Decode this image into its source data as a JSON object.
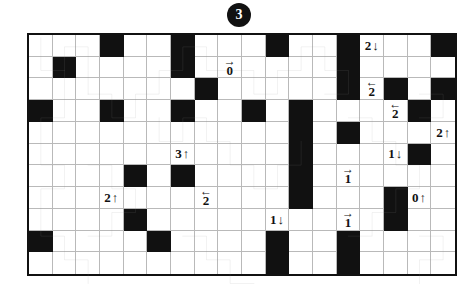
{
  "puzzle": {
    "number": "3",
    "type": "loop-path-grid-puzzle",
    "grid": {
      "columns": 18,
      "rows": 11
    },
    "colors": {
      "block": "#111111",
      "loop": "#9a9a9a",
      "gridline": "#b9b9b9",
      "border": "#111111",
      "background": "#ffffff"
    },
    "blocked_cells": [
      [
        0,
        3
      ],
      [
        0,
        6
      ],
      [
        0,
        10
      ],
      [
        0,
        13
      ],
      [
        0,
        17
      ],
      [
        1,
        1
      ],
      [
        1,
        6
      ],
      [
        1,
        13
      ],
      [
        2,
        7
      ],
      [
        2,
        13
      ],
      [
        2,
        15
      ],
      [
        2,
        17
      ],
      [
        3,
        0
      ],
      [
        3,
        3
      ],
      [
        3,
        6
      ],
      [
        3,
        9
      ],
      [
        3,
        11
      ],
      [
        3,
        16
      ],
      [
        4,
        11
      ],
      [
        4,
        13
      ],
      [
        5,
        11
      ],
      [
        5,
        16
      ],
      [
        6,
        4
      ],
      [
        6,
        6
      ],
      [
        6,
        11
      ],
      [
        7,
        11
      ],
      [
        7,
        15
      ],
      [
        8,
        4
      ],
      [
        8,
        15
      ],
      [
        9,
        0
      ],
      [
        9,
        5
      ],
      [
        9,
        10
      ],
      [
        9,
        13
      ],
      [
        10,
        10
      ],
      [
        10,
        13
      ]
    ],
    "clues": [
      {
        "row": 0,
        "col": 14,
        "value": "2",
        "arrow": "down",
        "layout": "inline"
      },
      {
        "row": 1,
        "col": 8,
        "value": "0",
        "arrow": "right",
        "layout": "stacked"
      },
      {
        "row": 2,
        "col": 14,
        "value": "2",
        "arrow": "left",
        "layout": "stacked"
      },
      {
        "row": 3,
        "col": 15,
        "value": "2",
        "arrow": "left",
        "layout": "stacked"
      },
      {
        "row": 4,
        "col": 13,
        "value": "5",
        "arrow": "left",
        "layout": "stacked"
      },
      {
        "row": 4,
        "col": 17,
        "value": "2",
        "arrow": "up",
        "layout": "inline"
      },
      {
        "row": 5,
        "col": 6,
        "value": "3",
        "arrow": "up",
        "layout": "inline"
      },
      {
        "row": 5,
        "col": 15,
        "value": "1",
        "arrow": "down",
        "layout": "inline"
      },
      {
        "row": 5,
        "col": 16,
        "value": "2",
        "arrow": "up",
        "layout": "inline"
      },
      {
        "row": 6,
        "col": 6,
        "value": "1",
        "arrow": "right",
        "layout": "stacked"
      },
      {
        "row": 6,
        "col": 13,
        "value": "1",
        "arrow": "right",
        "layout": "stacked"
      },
      {
        "row": 7,
        "col": 3,
        "value": "2",
        "arrow": "up",
        "layout": "inline"
      },
      {
        "row": 7,
        "col": 7,
        "value": "2",
        "arrow": "left",
        "layout": "stacked"
      },
      {
        "row": 7,
        "col": 16,
        "value": "0",
        "arrow": "up",
        "layout": "inline"
      },
      {
        "row": 8,
        "col": 10,
        "value": "1",
        "arrow": "down",
        "layout": "inline"
      },
      {
        "row": 8,
        "col": 13,
        "value": "1",
        "arrow": "right",
        "layout": "stacked"
      },
      {
        "row": 8,
        "col": 15,
        "value": "1",
        "arrow": "down",
        "layout": "inline"
      },
      {
        "row": 9,
        "col": 5,
        "value": "2",
        "arrow": "left",
        "layout": "stacked"
      }
    ],
    "arrow_glyphs": {
      "up": "↑",
      "down": "↓",
      "left": "←",
      "right": "→"
    },
    "loop_segments": [
      "M 0.5 0.12 L 0.5 1.5 L 1.5 1.5 L 1.5 0.5 L 2.5 0.5 L 2.5 1.5 L 2.5 2.5",
      "M 1.5 1.5 L 1.5 3.5 L 0.5 3.5 L 0.5 5.5 L 1.5 5.5 L 1.5 6.5 L 0.5 6.5 L 0.5 8.5 L 1.5 8.5 L 1.5 9.5 L 2.5 9.5 L 2.5 10.5",
      "M 2.5 2.5 L 3.5 2.5 L 3.5 3.5 L 4.5 3.5 L 4.5 2.5 L 5.5 2.5 L 5.5 1.5 L 6.5 1.5 L 6.5 0.5 L 7.5 0.5 L 7.5 1.5 L 8.5 1.5",
      "M 2.5 5.5 L 3.5 5.5 L 3.5 6.5 L 4.5 6.5 L 4.5 7.5 L 3.5 7.5 L 3.5 8.5 L 2.5 8.5",
      "M 5.5 3.5 L 5.5 4.5 L 6.5 4.5 L 6.5 3.5 L 7.5 3.5 L 7.5 4.5 L 8.5 4.5 L 8.5 5.5 L 9.5 5.5 L 9.5 6.5 L 10.5 6.5 L 10.5 5.5 L 11.5 5.5 L 11.5 4.5",
      "M 8.5 1.5 L 9.5 1.5 L 9.5 2.5 L 10.5 2.5 L 10.5 1.5 L 11.5 1.5 L 11.5 0.5 L 12.5 0.5 L 12.5 1.5 L 13.5 1.5 L 13.5 2.5 L 12.5 2.5",
      "M 13.5 3.5 L 14.5 3.5 L 14.5 4.5 L 15.5 4.5 L 15.5 5.5 L 16.5 5.5 L 16.5 6.5 L 15.5 6.5 L 15.5 7.5 L 14.5 7.5 L 14.5 8.5 L 13.5 8.5",
      "M 6.5 8.5 L 7.5 8.5 L 7.5 9.5 L 8.5 9.5 L 8.5 10.5 L 9.5 10.5",
      "M 16.5 2.5 L 17.5 2.5 L 17.5 3.5 L 16.5 3.5",
      "M 16.5 8.5 L 17.5 8.5 L 17.5 9.5 L 16.5 9.5 L 16.5 10.5"
    ]
  }
}
